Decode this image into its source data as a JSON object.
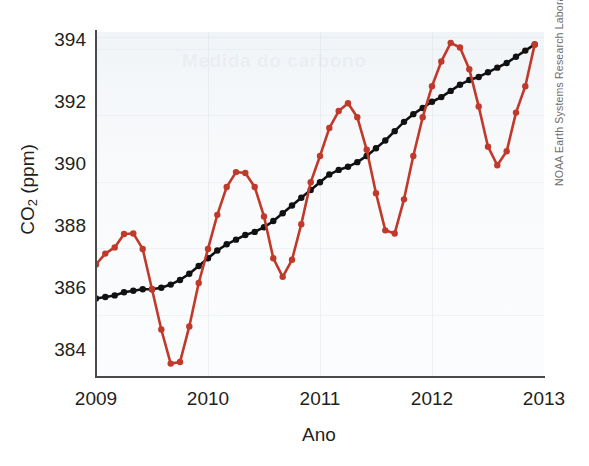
{
  "figure": {
    "bleed_through_text": "Medida do carbono"
  },
  "axes": {
    "y_title_prefix": "CO",
    "y_title_sub": "2",
    "y_title_suffix": " (ppm)",
    "x_title": "Ano",
    "y_ticks": [
      "394",
      "392",
      "390",
      "388",
      "386",
      "384"
    ],
    "x_ticks": [
      "2009",
      "2010",
      "2011",
      "2012",
      "2013"
    ]
  },
  "credit": {
    "text": "NOAA Earth Systems Research Laboratory"
  },
  "colors": {
    "monthly_series": "#c0392b",
    "trend_series": "#111111",
    "axis": "#4a4a4a",
    "text": "#231f20",
    "plot_background": "#fbfcfd"
  },
  "chart_data": {
    "type": "line",
    "title": "",
    "xlabel": "Ano",
    "ylabel": "CO2 (ppm)",
    "xlim": [
      2009.0,
      2013.0
    ],
    "ylim": [
      383.2,
      394.3
    ],
    "y_tick_values": [
      394,
      392,
      390,
      388,
      386,
      384
    ],
    "x_tick_values": [
      2009,
      2010,
      2011,
      2012,
      2013
    ],
    "grid": true,
    "legend_position": "none",
    "annotations": [
      "NOAA Earth Systems Research Laboratory"
    ],
    "series": [
      {
        "name": "Monthly mean CO2",
        "color": "#c0392b",
        "marker": "circle",
        "x": [
          2009.0,
          2009.083,
          2009.167,
          2009.25,
          2009.333,
          2009.417,
          2009.5,
          2009.583,
          2009.667,
          2009.75,
          2009.833,
          2009.917,
          2010.0,
          2010.083,
          2010.167,
          2010.25,
          2010.333,
          2010.417,
          2010.5,
          2010.583,
          2010.667,
          2010.75,
          2010.833,
          2010.917,
          2011.0,
          2011.083,
          2011.167,
          2011.25,
          2011.333,
          2011.417,
          2011.5,
          2011.583,
          2011.667,
          2011.75,
          2011.833,
          2011.917,
          2012.0,
          2012.083,
          2012.167,
          2012.25,
          2012.333,
          2012.417,
          2012.5,
          2012.583,
          2012.667,
          2012.75,
          2012.833,
          2012.917
        ],
        "y": [
          386.8,
          387.15,
          387.35,
          387.78,
          387.8,
          387.3,
          386.0,
          384.7,
          383.6,
          383.65,
          384.8,
          386.2,
          387.3,
          388.4,
          389.3,
          389.78,
          389.75,
          389.3,
          388.35,
          387.0,
          386.4,
          386.95,
          388.1,
          389.45,
          390.3,
          391.2,
          391.75,
          392.0,
          391.55,
          390.5,
          389.1,
          387.9,
          387.8,
          388.9,
          390.3,
          391.55,
          392.55,
          393.35,
          393.95,
          393.8,
          393.1,
          391.9,
          390.6,
          390.0,
          390.45,
          391.7,
          392.55,
          393.9
        ]
      },
      {
        "name": "Seasonally corrected trend",
        "color": "#111111",
        "marker": "circle",
        "x": [
          2009.0,
          2009.083,
          2009.167,
          2009.25,
          2009.333,
          2009.417,
          2009.5,
          2009.583,
          2009.667,
          2009.75,
          2009.833,
          2009.917,
          2010.0,
          2010.083,
          2010.167,
          2010.25,
          2010.333,
          2010.417,
          2010.5,
          2010.583,
          2010.667,
          2010.75,
          2010.833,
          2010.917,
          2011.0,
          2011.083,
          2011.167,
          2011.25,
          2011.333,
          2011.417,
          2011.5,
          2011.583,
          2011.667,
          2011.75,
          2011.833,
          2011.917,
          2012.0,
          2012.083,
          2012.167,
          2012.25,
          2012.333,
          2012.417,
          2012.5,
          2012.583,
          2012.667,
          2012.75,
          2012.833,
          2012.917
        ],
        "y": [
          385.7,
          385.75,
          385.8,
          385.9,
          385.95,
          386.0,
          386.0,
          386.05,
          386.15,
          386.3,
          386.5,
          386.75,
          387.0,
          387.25,
          387.45,
          387.6,
          387.75,
          387.85,
          388.0,
          388.2,
          388.45,
          388.7,
          388.95,
          389.2,
          389.45,
          389.7,
          389.85,
          389.95,
          390.1,
          390.3,
          390.55,
          390.8,
          391.1,
          391.4,
          391.65,
          391.85,
          392.05,
          392.2,
          392.4,
          392.6,
          392.75,
          392.85,
          393.0,
          393.15,
          393.3,
          393.5,
          393.7,
          393.9
        ]
      }
    ]
  }
}
